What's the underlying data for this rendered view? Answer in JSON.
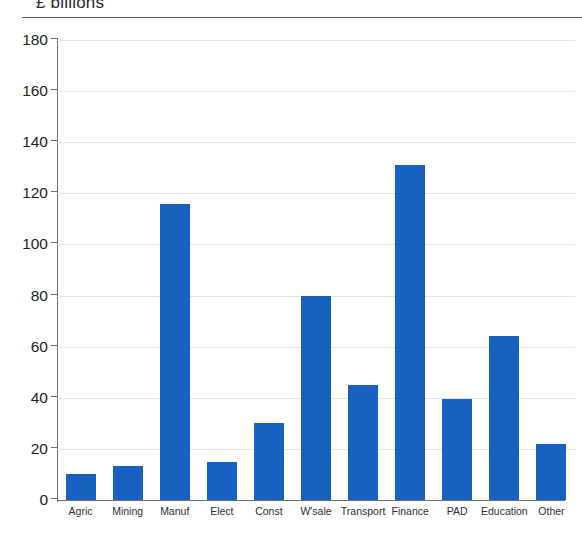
{
  "header": {
    "unit_caption": "£ billions"
  },
  "chart_data": {
    "type": "bar",
    "title": "",
    "subtitle": "",
    "xlabel": "",
    "ylabel": "£ billions",
    "ylim": [
      0,
      180
    ],
    "ytick_step": 20,
    "yticks": [
      0,
      20,
      40,
      60,
      80,
      100,
      120,
      140,
      160,
      180
    ],
    "ytick_labels": [
      "0",
      "20",
      "40",
      "60",
      "80",
      "100",
      "120",
      "140",
      "160",
      "180"
    ],
    "grid": "horizontal",
    "legend": "none",
    "bar_color": "#1861c0",
    "categories": [
      "Agric",
      "Mining",
      "Manuf",
      "Elect",
      "Const",
      "W'sale",
      "Transport",
      "Finance",
      "PAD",
      "Education",
      "Other"
    ],
    "values": [
      10,
      13.5,
      116,
      15,
      30,
      80,
      45,
      131,
      39.5,
      64,
      22
    ],
    "series": [
      {
        "name": "",
        "values": [
          10,
          13.5,
          116,
          15,
          30,
          80,
          45,
          131,
          39.5,
          64,
          22
        ]
      }
    ],
    "annotations": []
  },
  "colors": {
    "bar": "#1861c0",
    "axis": "#6d6d6d",
    "grid": "#e3e3e3",
    "text": "#231f20",
    "background": "#ffffff"
  }
}
